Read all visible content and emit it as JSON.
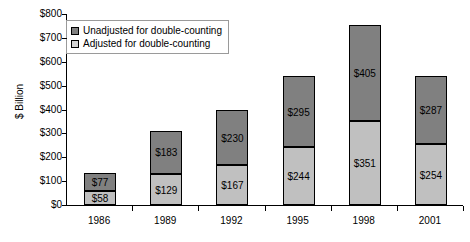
{
  "chart_data": {
    "type": "bar",
    "subtype": "stacked-vertical",
    "title": "",
    "xlabel": "",
    "ylabel": "$ Billion",
    "ylim": [
      0,
      800
    ],
    "ytick_step": 100,
    "ytick_labels": [
      "$800",
      "$700",
      "$600",
      "$500",
      "$400",
      "$300",
      "$200",
      "$100",
      "$0"
    ],
    "ytick_values": [
      800,
      700,
      600,
      500,
      400,
      300,
      200,
      100,
      0
    ],
    "grid": false,
    "legend_position": "top-left inside plot",
    "categories": [
      "1986",
      "1989",
      "1992",
      "1995",
      "1998",
      "2001"
    ],
    "series": [
      {
        "name": "Adjusted for double-counting",
        "stack_position": "bottom",
        "color": "#c0c0c0",
        "values": [
          58,
          129,
          167,
          244,
          351,
          254
        ],
        "data_labels": [
          "$58",
          "$129",
          "$167",
          "$244",
          "$351",
          "$254"
        ]
      },
      {
        "name": "Unadjusted for double-counting",
        "stack_position": "top",
        "color": "#808080",
        "values": [
          77,
          183,
          230,
          295,
          405,
          287
        ],
        "data_labels": [
          "$77",
          "$183",
          "$230",
          "$295",
          "$405",
          "$287"
        ]
      }
    ],
    "stack_totals": [
      135,
      312,
      397,
      539,
      756,
      541
    ]
  },
  "legend": {
    "entries": [
      {
        "label": "Unadjusted for double-counting",
        "swatch": "dark-gray-swatch-icon"
      },
      {
        "label": "Adjusted for double-counting",
        "swatch": "light-gray-swatch-icon"
      }
    ]
  },
  "colors": {
    "unadjusted": "#808080",
    "adjusted": "#c0c0c0",
    "axis": "#000000",
    "background": "#ffffff",
    "legend_border": "#9a9a9a"
  }
}
